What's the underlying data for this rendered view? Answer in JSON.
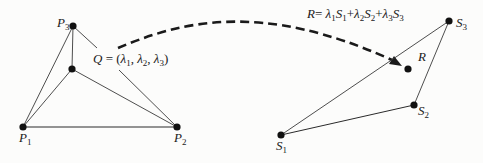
{
  "diagram": {
    "left_triangle": {
      "vertices": {
        "p1": {
          "name": "P",
          "sub": "1"
        },
        "p2": {
          "name": "P",
          "sub": "2"
        },
        "p3": {
          "name": "P",
          "sub": "3"
        }
      },
      "interior_point": {
        "label_var": "Q",
        "label_eq": " = (",
        "lambda": "λ",
        "sub1": "1",
        "sep1": ", ",
        "sub2": "2",
        "sep2": ", ",
        "sub3": "3",
        "close": ")"
      }
    },
    "right_triangle": {
      "vertices": {
        "s1": {
          "name": "S",
          "sub": "1"
        },
        "s2": {
          "name": "S",
          "sub": "2"
        },
        "s3": {
          "name": "S",
          "sub": "3"
        }
      },
      "interior_point": {
        "label": "R"
      }
    },
    "formula": {
      "lhs": "R",
      "eq": "= ",
      "lambda": "λ",
      "s": "S",
      "plus": "+",
      "sub1": "1",
      "sub2": "2",
      "sub3": "3"
    },
    "arrow": {
      "style": "dashed",
      "from": "Q",
      "to": "R"
    }
  }
}
